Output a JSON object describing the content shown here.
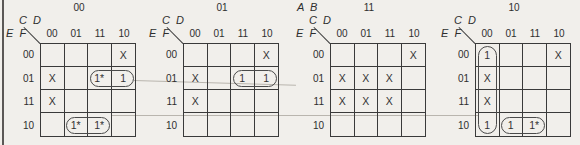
{
  "figure": {
    "plane_label": "A B",
    "col_label": "C D",
    "row_label": "E F",
    "col_headers": [
      "00",
      "01",
      "11",
      "10"
    ],
    "row_headers": [
      "00",
      "01",
      "11",
      "10"
    ],
    "maps": [
      {
        "ab": "00",
        "show_plane_label": false,
        "cells": [
          [
            "",
            "",
            "",
            "X"
          ],
          [
            "X",
            "",
            "1*",
            "1"
          ],
          [
            "X",
            "",
            "",
            ""
          ],
          [
            "",
            "1*",
            "1*",
            ""
          ]
        ],
        "groups": [
          {
            "orient": "h",
            "row": 1,
            "col_start": 2,
            "col_end": 3
          },
          {
            "orient": "h",
            "row": 3,
            "col_start": 1,
            "col_end": 2
          }
        ]
      },
      {
        "ab": "01",
        "show_plane_label": false,
        "cells": [
          [
            "",
            "",
            "",
            "X"
          ],
          [
            "X",
            "",
            "1",
            "1"
          ],
          [
            "X",
            "",
            "",
            ""
          ],
          [
            "",
            "",
            "",
            ""
          ]
        ],
        "groups": [
          {
            "orient": "h",
            "row": 1,
            "col_start": 2,
            "col_end": 3
          }
        ]
      },
      {
        "ab": "11",
        "show_plane_label": true,
        "cells": [
          [
            "",
            "",
            "",
            "X"
          ],
          [
            "X",
            "X",
            "X",
            ""
          ],
          [
            "X",
            "X",
            "X",
            ""
          ],
          [
            "",
            "",
            "",
            ""
          ]
        ],
        "groups": []
      },
      {
        "ab": "10",
        "show_plane_label": false,
        "cells": [
          [
            "1",
            "",
            "",
            "X"
          ],
          [
            "X",
            "",
            "",
            ""
          ],
          [
            "X",
            "",
            "",
            ""
          ],
          [
            "1",
            "1",
            "1*",
            ""
          ]
        ],
        "groups": [
          {
            "orient": "v",
            "col": 0,
            "row_start": 0,
            "row_end": 3
          },
          {
            "orient": "h",
            "row": 3,
            "col_start": 1,
            "col_end": 2
          }
        ]
      }
    ],
    "connectors": [
      {
        "row": 1,
        "from_map": 0,
        "to_map": 1
      },
      {
        "row": 3,
        "from_map": 0,
        "to_map": 3
      }
    ]
  },
  "colors": {
    "background": "#f1efeb",
    "grid_line": "#3a3a3a",
    "text": "#2e2e2e",
    "group_outline": "#4a4a4a",
    "connector_line": "#b9b5ae",
    "page_edge": "#5b5856"
  }
}
